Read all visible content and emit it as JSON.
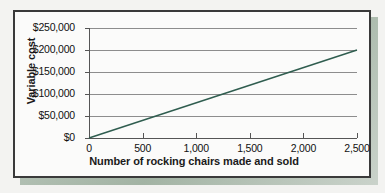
{
  "chart_data": {
    "type": "line",
    "title": "",
    "xlabel": "Number of rocking chairs made and sold",
    "ylabel": "Variable cost",
    "x": [
      0,
      2500
    ],
    "values": [
      0,
      200000
    ],
    "series": [
      {
        "name": "Variable cost",
        "color": "#2f5d4f",
        "x": [
          0,
          2500
        ],
        "values": [
          0,
          200000
        ]
      }
    ],
    "xlim": [
      0,
      2500
    ],
    "ylim": [
      0,
      250000
    ],
    "xticks": [
      0,
      500,
      1000,
      1500,
      2000,
      2500
    ],
    "yticks": [
      0,
      50000,
      100000,
      150000,
      200000,
      250000
    ],
    "xtick_labels": [
      "0",
      "500",
      "1,000",
      "1,500",
      "2,000",
      "2,500"
    ],
    "ytick_labels": [
      "$0",
      "$50,000",
      "$100,000",
      "$150,000",
      "$200,000",
      "$250,000"
    ],
    "grid": true,
    "grid_axis": "y",
    "legend": false,
    "legend_position": "none"
  },
  "style": {
    "line_color": "#2f5d4f",
    "grid_color": "#8d8d8d",
    "axis_color": "#555555",
    "frame_color": "#3a3a3a",
    "plot_background": "#fbfbfa",
    "page_background": "#f3f3f1",
    "shadow_color": "#94a896",
    "text_color": "#111111"
  }
}
